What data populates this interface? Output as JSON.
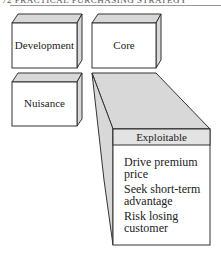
{
  "running_header": "72   PRACTICAL PURCHASING STRATEGY",
  "colors": {
    "face": "#ffffff",
    "shade": "#d8d8d8",
    "band": "#e3e3e3",
    "stroke": "#333333"
  },
  "boxes": {
    "development": {
      "label": "Development"
    },
    "core": {
      "label": "Core"
    },
    "nuisance": {
      "label": "Nuisance"
    },
    "exploitable": {
      "label": "Exploitable",
      "items": [
        [
          "Drive premium",
          "price"
        ],
        [
          "Seek short-term",
          "advantage"
        ],
        [
          "Risk losing",
          "customer"
        ]
      ]
    }
  }
}
